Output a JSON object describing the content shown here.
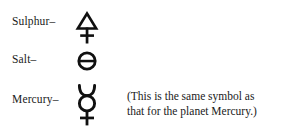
{
  "page": {
    "background_color": "#ffffff",
    "text_color": "#1a1a1a"
  },
  "rows": [
    {
      "label": "Sulphur–",
      "symbol_name": "alchemical-symbol-sulphur",
      "symbol_char": "🜍",
      "symbol_description": "triangle above a cross"
    },
    {
      "label": "Salt–",
      "symbol_name": "alchemical-symbol-salt",
      "symbol_char": "🜔",
      "symbol_description": "circle bisected by a horizontal line"
    },
    {
      "label": "Mercury–",
      "symbol_name": "alchemical-symbol-mercury",
      "symbol_char": "☿",
      "symbol_description": "crescent horns above a circle above a cross"
    }
  ],
  "note": {
    "line1": "(This is the same symbol as",
    "line2": "that for the planet Mercury.)"
  }
}
